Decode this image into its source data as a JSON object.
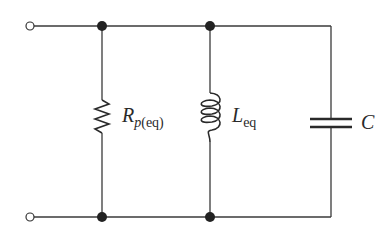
{
  "diagram": {
    "type": "parallel RLC circuit",
    "components": [
      {
        "id": "resistor",
        "symbol": "R",
        "subscript_italic": "p",
        "subscript": "(eq)",
        "label": "Rp(eq)"
      },
      {
        "id": "inductor",
        "symbol": "L",
        "subscript": "eq",
        "label": "Leq"
      },
      {
        "id": "capacitor",
        "symbol": "C",
        "subscript": "",
        "label": "C"
      }
    ],
    "terminals": [
      "top-left",
      "bottom-left"
    ],
    "nodes": 4,
    "colors": {
      "line": "#3a3a3a",
      "background": "#ffffff"
    }
  }
}
